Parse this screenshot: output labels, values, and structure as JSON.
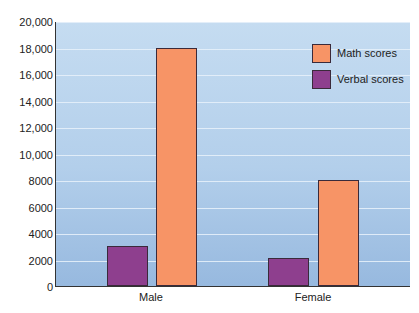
{
  "chart_data": {
    "type": "bar",
    "title": "",
    "xlabel": "",
    "ylabel": "",
    "categories": [
      "Male",
      "Female"
    ],
    "series": [
      {
        "name": "Verbal scores",
        "color": "#8e3f8e",
        "values": [
          3000,
          2100
        ]
      },
      {
        "name": "Math scores",
        "color": "#f79466",
        "values": [
          18000,
          8000
        ]
      }
    ],
    "ylim": [
      0,
      20000
    ],
    "yticks": [
      0,
      2000,
      4000,
      6000,
      8000,
      10000,
      12000,
      14000,
      16000,
      18000,
      20000
    ],
    "ytick_labels": [
      "0",
      "2000",
      "4000",
      "6000",
      "8000",
      "10,000",
      "12,000",
      "14,000",
      "16,000",
      "18,000",
      "20,000"
    ],
    "grid": true,
    "legend": {
      "position": "upper right",
      "entries": [
        {
          "label": "Math scores",
          "color": "#f79466"
        },
        {
          "label": "Verbal scores",
          "color": "#8e3f8e"
        }
      ]
    }
  }
}
